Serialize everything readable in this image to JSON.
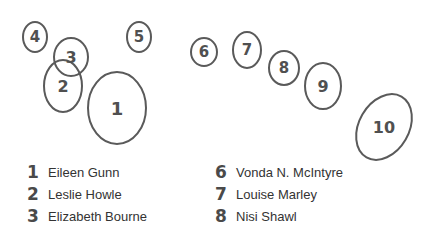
{
  "colors": {
    "stroke": "#5a5a5a",
    "label": "#505050",
    "text": "#333333",
    "background": "#ffffff"
  },
  "ellipses": [
    {
      "label": "1",
      "cx": 117,
      "cy": 108,
      "rx": 29,
      "ry": 36,
      "rot": 0,
      "fs": 18
    },
    {
      "label": "2",
      "cx": 63,
      "cy": 86,
      "rx": 19,
      "ry": 26,
      "rot": 0,
      "fs": 16
    },
    {
      "label": "3",
      "cx": 71,
      "cy": 57,
      "rx": 17,
      "ry": 19,
      "rot": 0,
      "fs": 16
    },
    {
      "label": "4",
      "cx": 35,
      "cy": 37,
      "rx": 12,
      "ry": 15,
      "rot": 0,
      "fs": 15
    },
    {
      "label": "5",
      "cx": 139,
      "cy": 37,
      "rx": 12,
      "ry": 15,
      "rot": 0,
      "fs": 15
    },
    {
      "label": "6",
      "cx": 204,
      "cy": 52,
      "rx": 13,
      "ry": 14,
      "rot": 0,
      "fs": 15
    },
    {
      "label": "7",
      "cx": 247,
      "cy": 50,
      "rx": 14,
      "ry": 18,
      "rot": 0,
      "fs": 15
    },
    {
      "label": "8",
      "cx": 284,
      "cy": 68,
      "rx": 15,
      "ry": 17,
      "rot": 0,
      "fs": 15
    },
    {
      "label": "9",
      "cx": 323,
      "cy": 86,
      "rx": 18,
      "ry": 23,
      "rot": 0,
      "fs": 16
    },
    {
      "label": "10",
      "cx": 384,
      "cy": 127,
      "rx": 25,
      "ry": 35,
      "rot": 30,
      "fs": 16
    }
  ],
  "legend": {
    "left": [
      {
        "num": "1",
        "name": "Eileen Gunn"
      },
      {
        "num": "2",
        "name": "Leslie Howle"
      },
      {
        "num": "3",
        "name": "Elizabeth Bourne"
      }
    ],
    "right": [
      {
        "num": "6",
        "name": "Vonda N. McIntyre"
      },
      {
        "num": "7",
        "name": "Louise Marley"
      },
      {
        "num": "8",
        "name": "Nisi Shawl"
      }
    ]
  }
}
